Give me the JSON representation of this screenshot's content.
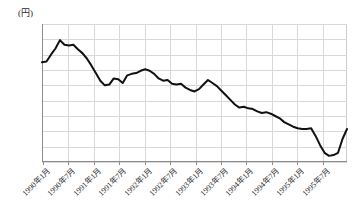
{
  "unit_label": "(円)",
  "axis": {
    "y_ticks": [
      170,
      160,
      150,
      140,
      130,
      120,
      110,
      100,
      90,
      80
    ],
    "x_tick_labels": [
      "1990年1月",
      "1990年7月",
      "1991年1月",
      "1991年7月",
      "1992年1月",
      "1992年7月",
      "1993年1月",
      "1993年7月",
      "1994年1月",
      "1994年7月",
      "1995年1月",
      "1995年7月"
    ]
  },
  "colors": {
    "line": "#111111",
    "grid": "#d8d8d8",
    "axis": "#8d8d8d",
    "text": "#2b2b2b",
    "background": "#ffffff"
  },
  "chart_data": {
    "type": "line",
    "title": "",
    "subtitle": "",
    "xlabel": "",
    "ylabel": "(円)",
    "ylim": [
      80,
      170
    ],
    "grid": true,
    "legend": "none",
    "series": [
      {
        "name": "月次推移",
        "x": [
          "1990年1月",
          "1990年2月",
          "1990年3月",
          "1990年4月",
          "1990年5月",
          "1990年6月",
          "1990年7月",
          "1990年8月",
          "1990年9月",
          "1990年10月",
          "1990年11月",
          "1990年12月",
          "1991年1月",
          "1991年2月",
          "1991年3月",
          "1991年4月",
          "1991年5月",
          "1991年6月",
          "1991年7月",
          "1991年8月",
          "1991年9月",
          "1991年10月",
          "1991年11月",
          "1991年12月",
          "1992年1月",
          "1992年2月",
          "1992年3月",
          "1992年4月",
          "1992年5月",
          "1992年6月",
          "1992年7月",
          "1992年8月",
          "1992年9月",
          "1992年10月",
          "1992年11月",
          "1992年12月",
          "1993年1月",
          "1993年2月",
          "1993年3月",
          "1993年4月",
          "1993年5月",
          "1993年6月",
          "1993年7月",
          "1993年8月",
          "1993年9月",
          "1993年10月",
          "1993年11月",
          "1993年12月",
          "1994年1月",
          "1994年2月",
          "1994年3月",
          "1994年4月",
          "1994年5月",
          "1994年6月",
          "1994年7月",
          "1994年8月",
          "1994年9月",
          "1994年10月",
          "1994年11月",
          "1994年12月",
          "1995年1月",
          "1995年2月",
          "1995年3月",
          "1995年4月",
          "1995年5月",
          "1995年6月",
          "1995年7月",
          "1995年8月",
          "1995年9月"
        ],
        "values": [
          145,
          145.5,
          150,
          154,
          159.5,
          156.5,
          156,
          156.5,
          153.5,
          151,
          147.5,
          143,
          138,
          133,
          130,
          130.5,
          134.5,
          134,
          131.5,
          136.5,
          137.5,
          138,
          139.5,
          140.5,
          139.5,
          137.5,
          134.5,
          133,
          133.5,
          131,
          130.5,
          131,
          128.5,
          127,
          126,
          127.5,
          130.5,
          133.5,
          131.5,
          129.5,
          126.5,
          123.5,
          120.5,
          117.5,
          115.5,
          116,
          115,
          114.5,
          113,
          112,
          112.5,
          111.5,
          110,
          108.5,
          106,
          104.5,
          103,
          102,
          101.5,
          101.5,
          102,
          97,
          91,
          86,
          84,
          84.5,
          86,
          95,
          101.5
        ]
      }
    ],
    "annotations": {
      "start_value": 145,
      "peak_value": 159.5,
      "peak_x": "1990年5月",
      "trough_value": 84,
      "trough_x": "1995年5月",
      "end_value": 101.5,
      "end_x": "1995年9月"
    }
  }
}
